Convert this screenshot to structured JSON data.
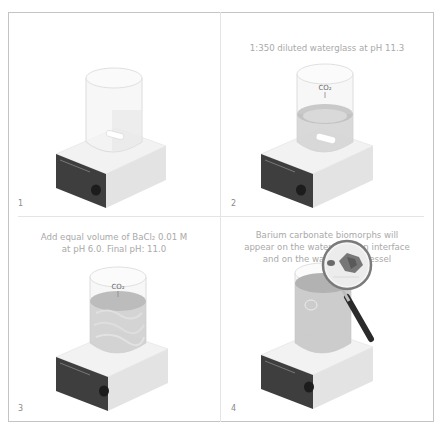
{
  "figure": {
    "panels": [
      {
        "number": "1",
        "caption": "",
        "co2_label": "",
        "liquid": "none",
        "magnifier": false
      },
      {
        "number": "2",
        "caption": "1:350 diluted waterglass at pH 11.3",
        "co2_label": "CO₂",
        "liquid": "clear",
        "magnifier": false
      },
      {
        "number": "3",
        "caption_line1": "Add equal volume of BaCl₂ 0.01 M",
        "caption_line2": "at pH 6.0. Final pH: 11.0",
        "co2_label": "CO₂",
        "liquid": "mixed",
        "magnifier": false
      },
      {
        "number": "4",
        "caption_line1": "Barium carbonate biomorphs will",
        "caption_line2": "appear on the water/solution interface",
        "caption_line3": "and on the walls of the vessel",
        "co2_label": "",
        "liquid": "filled",
        "magnifier": true
      }
    ],
    "bottom_caption_partial": "(clipped caption text below figure)"
  },
  "colors": {
    "frame_border": "#c4c4c4",
    "divider": "#e4e4e4",
    "caption_text": "#a9a9a9",
    "plate_top": "#f1f1f1",
    "plate_side": "#e2e2e2",
    "plate_front_panel": "#3d3d3d",
    "knob": "#1e1e1e",
    "glass": "#eeeeee",
    "liquid": "#c8c8c8",
    "magnifier_handle": "#2a2a2a"
  }
}
